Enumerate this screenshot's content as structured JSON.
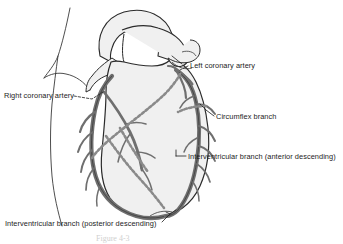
{
  "figure": {
    "caption": "Figure 4-3",
    "background_color": "#ffffff",
    "heart_fill_color": "#f0f0f0",
    "heart_outline_color": "#2b2b2b",
    "vessel_color": "#6f6f6f",
    "vessel_outline_color": "#303030",
    "hidden_vessel_style": "dashed",
    "label_color": "#1c1c1c"
  },
  "labels": {
    "left_coronary_artery": "Left coronary artery",
    "right_coronary_artery": "Right coronary artery",
    "circumflex_branch": "Circumflex branch",
    "interventricular_anterior": "Interventricular branch (anterior descending)",
    "interventricular_posterior": "Interventricular branch (posterior descending)"
  },
  "structures": [
    {
      "name": "aortic-arch",
      "visible": true
    },
    {
      "name": "superior-vena-cava",
      "visible": true
    },
    {
      "name": "pulmonary-trunk",
      "visible": true
    },
    {
      "name": "right-atrium",
      "visible": true
    },
    {
      "name": "right-ventricle",
      "visible": true
    },
    {
      "name": "left-ventricle",
      "visible": true
    },
    {
      "name": "apex-of-heart",
      "visible": true
    }
  ],
  "vessels": [
    {
      "name": "right-coronary-artery",
      "rendering": "solid",
      "side": "right"
    },
    {
      "name": "left-coronary-artery",
      "rendering": "solid",
      "side": "left"
    },
    {
      "name": "circumflex-branch",
      "rendering": "dashed",
      "side": "left"
    },
    {
      "name": "anterior-interventricular-branch",
      "rendering": "solid",
      "side": "left"
    },
    {
      "name": "posterior-interventricular-branch",
      "rendering": "dashed",
      "side": "right"
    }
  ]
}
